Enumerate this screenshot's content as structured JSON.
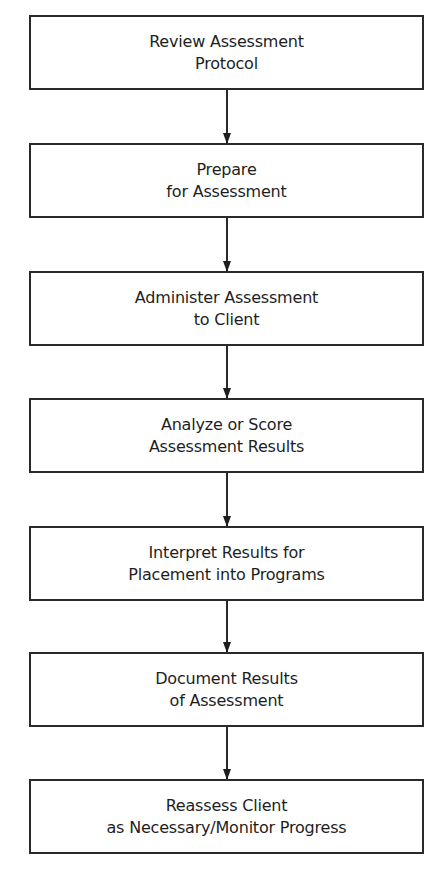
{
  "diagram": {
    "type": "vertical-flowchart",
    "colors": {
      "border": "#2a2a2a",
      "text": "#1e1e1e",
      "background": "#ffffff"
    },
    "steps": [
      {
        "line1": "Review Assessment",
        "line2": "Protocol"
      },
      {
        "line1": "Prepare",
        "line2": "for Assessment"
      },
      {
        "line1": "Administer Assessment",
        "line2": "to Client"
      },
      {
        "line1": "Analyze or Score",
        "line2": "Assessment Results"
      },
      {
        "line1": "Interpret Results for",
        "line2": "Placement into Programs"
      },
      {
        "line1": "Document Results",
        "line2": "of Assessment"
      },
      {
        "line1": "Reassess Client",
        "line2": "as Necessary/Monitor Progress"
      }
    ],
    "connectors": [
      {
        "from": 0,
        "to": 1,
        "icon": "arrow-down-icon"
      },
      {
        "from": 1,
        "to": 2,
        "icon": "arrow-down-icon"
      },
      {
        "from": 2,
        "to": 3,
        "icon": "arrow-down-icon"
      },
      {
        "from": 3,
        "to": 4,
        "icon": "arrow-down-icon"
      },
      {
        "from": 4,
        "to": 5,
        "icon": "arrow-down-icon"
      },
      {
        "from": 5,
        "to": 6,
        "icon": "arrow-down-icon"
      }
    ]
  }
}
